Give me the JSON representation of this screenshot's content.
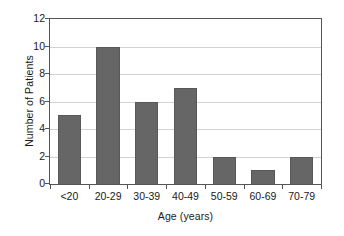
{
  "chart_data": {
    "type": "bar",
    "title": "",
    "subtitle": "",
    "xlabel": "Age (years)",
    "ylabel": "Number of Patients",
    "categories": [
      "<20",
      "20-29",
      "30-39",
      "40-49",
      "50-59",
      "60-69",
      "70-79"
    ],
    "values": [
      5,
      10,
      6,
      7,
      2,
      1,
      2
    ],
    "ylim": [
      0,
      12
    ],
    "yticks": [
      0,
      2,
      4,
      6,
      8,
      10,
      12
    ],
    "ytick_labels": [
      "0",
      "2",
      "4",
      "6",
      "8",
      "10",
      "12"
    ],
    "grid": "horizontal",
    "legend": "none",
    "annotations": [],
    "colors": {
      "bar_fill": "#666666",
      "bar_border": "#585858",
      "gridline": "#d2d2d2",
      "frame": "#555555",
      "background": "#ffffff",
      "text": "#1a1a1a"
    }
  }
}
